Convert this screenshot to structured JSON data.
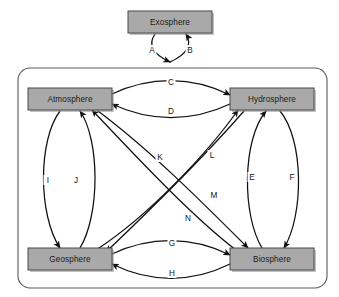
{
  "diagram": {
    "colors": {
      "box_fill": "#a9a9a9",
      "box_stroke": "#4a4a4a",
      "arrow": "#111111",
      "frame": "#5a5a5a",
      "background": "#ffffff"
    },
    "nodes": [
      {
        "id": "exosphere",
        "label": "Exosphere",
        "x": 170,
        "y": 22,
        "w": 84,
        "h": 22,
        "inside_frame": false
      },
      {
        "id": "atmosphere",
        "label": "Atmosphere",
        "x": 70,
        "y": 99,
        "w": 84,
        "h": 22,
        "inside_frame": true
      },
      {
        "id": "hydrosphere",
        "label": "Hydrosphere",
        "x": 272,
        "y": 99,
        "w": 84,
        "h": 22,
        "inside_frame": true
      },
      {
        "id": "geosphere",
        "label": "Geosphere",
        "x": 70,
        "y": 259,
        "w": 84,
        "h": 22,
        "inside_frame": true
      },
      {
        "id": "biosphere",
        "label": "Biosphere",
        "x": 272,
        "y": 259,
        "w": 84,
        "h": 22,
        "inside_frame": true
      }
    ],
    "frame": {
      "x": 18,
      "y": 68,
      "w": 309,
      "h": 220,
      "radius": 12
    },
    "edges": [
      {
        "id": "A",
        "label": "A",
        "from": "exosphere",
        "to": "frame-top",
        "label_x": 152,
        "label_y": 50,
        "path": "M 155,34 C 148,44 152,54 170,62",
        "arrow_at": "end"
      },
      {
        "id": "B",
        "label": "B",
        "from": "frame-top",
        "to": "exosphere",
        "label_x": 190,
        "label_y": 50,
        "path": "M 170,62 C 188,54 192,44 186,34",
        "arrow_at": "end"
      },
      {
        "id": "C",
        "label": "C",
        "from": "atmosphere",
        "to": "hydrosphere",
        "label_x": 171,
        "label_y": 82,
        "path": "M 112,94 C 150,76 192,76 230,95",
        "arrow_at": "end"
      },
      {
        "id": "D",
        "label": "D",
        "from": "hydrosphere",
        "to": "atmosphere",
        "label_x": 171,
        "label_y": 111,
        "path": "M 230,104 C 192,122 150,122 112,104",
        "arrow_at": "end"
      },
      {
        "id": "E",
        "label": "E",
        "from": "biosphere",
        "to": "hydrosphere",
        "label_x": 252,
        "label_y": 177,
        "path": "M 262,248 C 242,215 242,140 266,111",
        "arrow_at": "end"
      },
      {
        "id": "F",
        "label": "F",
        "from": "hydrosphere",
        "to": "biosphere",
        "label_x": 292,
        "label_y": 177,
        "path": "M 280,111 C 304,140 304,215 284,248",
        "arrow_at": "end"
      },
      {
        "id": "G",
        "label": "G",
        "from": "geosphere",
        "to": "biosphere",
        "label_x": 172,
        "label_y": 243,
        "path": "M 112,254 C 150,236 192,236 230,255",
        "arrow_at": "end"
      },
      {
        "id": "H",
        "label": "H",
        "from": "biosphere",
        "to": "geosphere",
        "label_x": 172,
        "label_y": 273,
        "path": "M 230,264 C 192,283 150,283 112,264",
        "arrow_at": "end"
      },
      {
        "id": "I",
        "label": "I",
        "from": "atmosphere",
        "to": "geosphere",
        "label_x": 48,
        "label_y": 180,
        "path": "M 60,111 C 38,140 38,215 60,248",
        "arrow_at": "end"
      },
      {
        "id": "J",
        "label": "J",
        "from": "geosphere",
        "to": "atmosphere",
        "label_x": 76,
        "label_y": 180,
        "path": "M 80,248 C 100,215 100,140 80,111",
        "arrow_at": "end"
      },
      {
        "id": "K",
        "label": "K",
        "from": "atmosphere",
        "to": "biosphere",
        "label_x": 160,
        "label_y": 157,
        "path": "M 98,111 C 150,150 200,200 248,248",
        "arrow_at": "end"
      },
      {
        "id": "L",
        "label": "L",
        "from": "hydrosphere",
        "to": "geosphere",
        "label_x": 212,
        "label_y": 155,
        "path": "M 244,111 C 210,150 150,210 106,252",
        "arrow_at": "end"
      },
      {
        "id": "M",
        "label": "M",
        "from": "geosphere",
        "to": "hydrosphere",
        "label_x": 214,
        "label_y": 195,
        "path": "M 96,250 C 150,215 210,150 238,110",
        "arrow_at": "end"
      },
      {
        "id": "N",
        "label": "N",
        "from": "biosphere",
        "to": "atmosphere",
        "label_x": 188,
        "label_y": 218,
        "path": "M 236,250 C 190,215 130,150 92,110",
        "arrow_at": "end"
      }
    ]
  }
}
